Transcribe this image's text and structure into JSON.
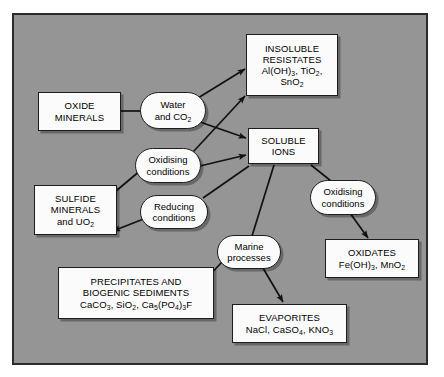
{
  "diagram": {
    "background_color": "#959595",
    "frame_border_color": "#2b2b2b",
    "node_fill_color": "#fbfbfb",
    "node_border_color": "#1d1d1d",
    "text_color": "#000000",
    "nodes": [
      {
        "id": "oxide-minerals",
        "shape": "rect",
        "lines": [
          "OXIDE",
          "MINERALS"
        ],
        "x": 38,
        "y": 92,
        "w": 83,
        "h": 39
      },
      {
        "id": "water-and-co2",
        "shape": "ellipse",
        "lines": [
          "Water",
          "and CO₂"
        ],
        "x": 140,
        "y": 92,
        "w": 66,
        "h": 37
      },
      {
        "id": "insoluble-resistates",
        "shape": "rect",
        "lines": [
          "INSOLUBLE",
          "RESISTATES",
          "Al(OH)₃, TiO₂,",
          "SnO₂"
        ],
        "x": 246,
        "y": 34,
        "w": 92,
        "h": 62
      },
      {
        "id": "soluble-ions",
        "shape": "rect",
        "lines": [
          "SOLUBLE",
          "IONS"
        ],
        "x": 248,
        "y": 128,
        "w": 71,
        "h": 36
      },
      {
        "id": "oxidising-conditions-left",
        "shape": "ellipse",
        "lines": [
          "Oxidising",
          "conditions"
        ],
        "x": 135,
        "y": 148,
        "w": 66,
        "h": 35
      },
      {
        "id": "reducing-conditions",
        "shape": "ellipse",
        "lines": [
          "Reducing",
          "conditions"
        ],
        "x": 140,
        "y": 195,
        "w": 68,
        "h": 34
      },
      {
        "id": "sulfide-minerals",
        "shape": "rect",
        "lines": [
          "SULFIDE",
          "MINERALS",
          "and UO₂"
        ],
        "x": 34,
        "y": 185,
        "w": 83,
        "h": 50
      },
      {
        "id": "oxidising-conditions-right",
        "shape": "ellipse",
        "lines": [
          "Oxidising",
          "conditions"
        ],
        "x": 310,
        "y": 180,
        "w": 66,
        "h": 35
      },
      {
        "id": "oxidates",
        "shape": "rect",
        "lines": [
          "OXIDATES",
          "Fe(OH)₃, MnO₂"
        ],
        "x": 325,
        "y": 239,
        "w": 94,
        "h": 39
      },
      {
        "id": "marine-processes",
        "shape": "ellipse",
        "lines": [
          "Marine",
          "processes"
        ],
        "x": 217,
        "y": 235,
        "w": 64,
        "h": 34
      },
      {
        "id": "precipitates-biogenic-sediments",
        "shape": "rect",
        "lines": [
          "PRECIPITATES AND",
          "BIOGENIC SEDIMENTS",
          "CaCO₃, SiO₂, Ca₅(PO₄)₃F"
        ],
        "x": 58,
        "y": 267,
        "w": 156,
        "h": 52
      },
      {
        "id": "evaporites",
        "shape": "rect",
        "lines": [
          "EVAPORITES",
          "NaCl, CaSO₄, KNO₃"
        ],
        "x": 232,
        "y": 304,
        "w": 115,
        "h": 39
      }
    ],
    "connections": [
      {
        "from": "oxide-minerals",
        "to": "water-and-co2",
        "arrow": false
      },
      {
        "from": "water-and-co2",
        "to": "insoluble-resistates",
        "arrow": true
      },
      {
        "from": "water-and-co2",
        "to": "soluble-ions",
        "arrow": true
      },
      {
        "from": "oxidising-conditions-left",
        "to": "insoluble-resistates",
        "arrow": true
      },
      {
        "from": "oxidising-conditions-left",
        "to": "soluble-ions",
        "arrow": true
      },
      {
        "from": "oxidising-conditions-left",
        "to": "sulfide-minerals",
        "arrow": true
      },
      {
        "from": "soluble-ions",
        "to": "reducing-conditions",
        "arrow": false
      },
      {
        "from": "reducing-conditions",
        "to": "sulfide-minerals",
        "arrow": true
      },
      {
        "from": "soluble-ions",
        "to": "oxidising-conditions-right",
        "arrow": false
      },
      {
        "from": "oxidising-conditions-right",
        "to": "oxidates",
        "arrow": true
      },
      {
        "from": "soluble-ions",
        "to": "marine-processes",
        "arrow": false
      },
      {
        "from": "marine-processes",
        "to": "precipitates-biogenic-sediments",
        "arrow": true
      },
      {
        "from": "marine-processes",
        "to": "evaporites",
        "arrow": true
      }
    ]
  }
}
